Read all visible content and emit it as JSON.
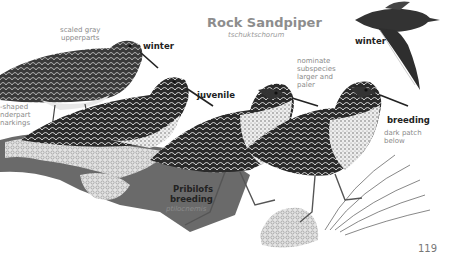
{
  "header": {
    "title": "Rock Sandpiper",
    "subtitle": "tschuktschorum"
  },
  "labels": {
    "scaled": [
      "scaled gray",
      "upperparts"
    ],
    "underpart": [
      "-shaped",
      "nderpart",
      "narkings"
    ],
    "nominate": [
      "nominate",
      "subspecies",
      "larger and",
      "paler"
    ],
    "dark_patch": [
      "dark patch",
      "below"
    ]
  },
  "plumages": {
    "winter_left": "winter",
    "juvenile": "juvenile",
    "winter_flight": "winter",
    "breeding": "breeding",
    "pribilofs": [
      "Pribilofs",
      "breeding"
    ],
    "pribilofs_ssp": "ptilocnemis"
  },
  "footer": {
    "page_number": "119"
  },
  "colors": {
    "ink": "#222222",
    "label_gray": "#8a8a8a",
    "rock": "#d8d8d8"
  }
}
